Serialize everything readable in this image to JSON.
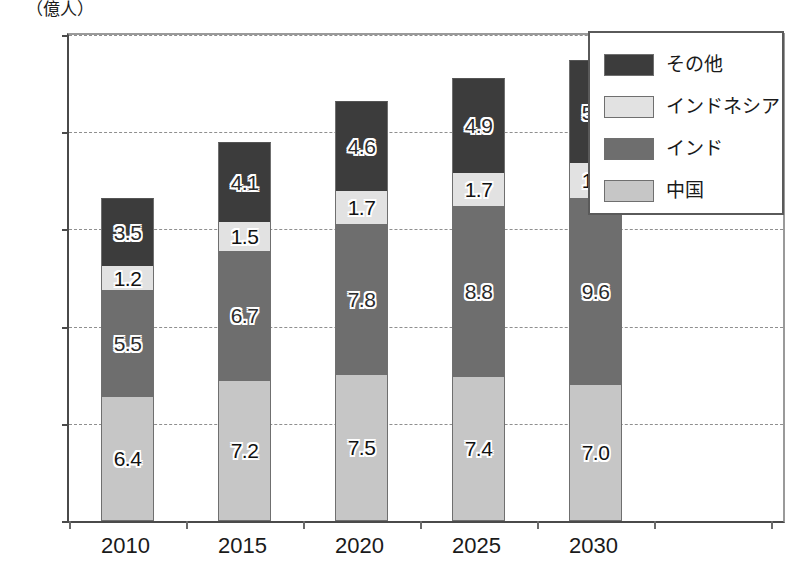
{
  "chart_data": {
    "type": "bar",
    "stacked": true,
    "title": "",
    "subtitle": "",
    "unit_label": "（億人）",
    "xlabel": "",
    "ylabel": "",
    "categories": [
      "2010",
      "2015",
      "2020",
      "2025",
      "2030"
    ],
    "ylim": [
      0.0,
      25.0
    ],
    "yticks": [
      "0.0",
      "5.0",
      "10.0",
      "15.0",
      "20.0",
      "25.0"
    ],
    "ytick_values": [
      0.0,
      5.0,
      10.0,
      15.0,
      20.0,
      25.0
    ],
    "grid": true,
    "grid_axis": "y",
    "grid_style": "dashed",
    "legend_position": "top-right",
    "series": [
      {
        "name": "中国",
        "color": "#c6c6c6",
        "values": [
          6.4,
          7.2,
          7.5,
          7.4,
          7.0
        ],
        "labels": [
          "6.4",
          "7.2",
          "7.5",
          "7.4",
          "7.0"
        ],
        "stack_order": 0
      },
      {
        "name": "インド",
        "color": "#6e6e6e",
        "values": [
          5.5,
          6.7,
          7.8,
          8.8,
          9.6
        ],
        "labels": [
          "5.5",
          "6.7",
          "7.8",
          "8.8",
          "9.6"
        ],
        "stack_order": 1
      },
      {
        "name": "インドネシア",
        "color": "#e2e2e2",
        "values": [
          1.2,
          1.5,
          1.7,
          1.7,
          1.8
        ],
        "labels": [
          "1.2",
          "1.5",
          "1.7",
          "1.7",
          "1.8"
        ],
        "stack_order": 2
      },
      {
        "name": "その他",
        "color": "#3c3c3c",
        "values": [
          3.5,
          4.1,
          4.6,
          4.9,
          5.3
        ],
        "labels": [
          "3.5",
          "4.1",
          "4.6",
          "4.9",
          "5.3"
        ],
        "stack_order": 3
      }
    ],
    "totals": [
      16.6,
      19.5,
      21.6,
      22.8,
      23.7
    ]
  },
  "legend": {
    "entries": [
      {
        "label": "その他",
        "color": "#3c3c3c"
      },
      {
        "label": "インドネシア",
        "color": "#e2e2e2"
      },
      {
        "label": "インド",
        "color": "#6e6e6e"
      },
      {
        "label": "中国",
        "color": "#c6c6c6"
      }
    ]
  },
  "colors": {
    "axis": "#4a4a4a",
    "grid": "#8f8f8f",
    "background": "#ffffff",
    "text": "#1a1a1a"
  }
}
